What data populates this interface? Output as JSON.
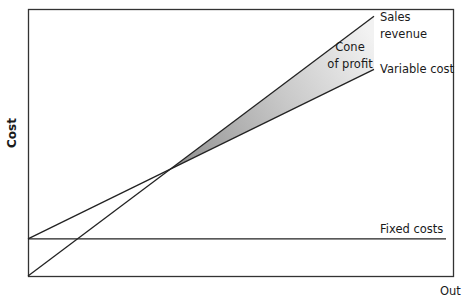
{
  "chart_data": {
    "type": "line",
    "title": "",
    "xlabel": "Output",
    "ylabel": "Cost",
    "xlim": [
      0,
      10
    ],
    "ylim": [
      0,
      10
    ],
    "grid": false,
    "legend": "inline labels at line ends",
    "x": [
      0,
      10
    ],
    "series": [
      {
        "name": "Sales revenue",
        "values": [
          0,
          9.8
        ]
      },
      {
        "name": "Variable cost",
        "values": [
          1.4,
          7.8
        ]
      },
      {
        "name": "Fixed costs",
        "values": [
          1.4,
          1.4
        ]
      }
    ],
    "annotations": [
      {
        "text": "Cone of profit",
        "type": "shaded-region",
        "between": [
          "Sales revenue",
          "Variable cost"
        ],
        "from_x": 4.2,
        "to_x": 10
      }
    ],
    "breakeven_x": 4.2
  },
  "labels": {
    "ylabel": "Cost",
    "sales_line1": "Sales",
    "sales_line2": "revenue",
    "variable": "Variable cost",
    "cone_line1": "Cone",
    "cone_line2": "of profit",
    "fixed": "Fixed costs",
    "xaxis_partial": "Out"
  },
  "colors": {
    "line": "#222222",
    "frame": "#333333",
    "cone_dark": "#8f8f8f",
    "cone_light": "#f2f2f2"
  }
}
